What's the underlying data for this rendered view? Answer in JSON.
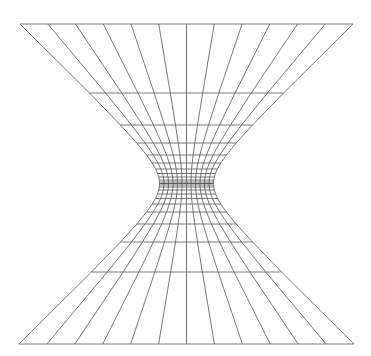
{
  "diagram": {
    "type": "hyperboloid-wireframe",
    "canvas": {
      "width": 371,
      "height": 356,
      "background": "#ffffff"
    },
    "stroke_color": "#555555",
    "center_x": 186.5,
    "waist_y": 183.5,
    "top_y": 24,
    "bottom_y": 344,
    "top_half_width": 166.5,
    "waist_half_width": 27,
    "vertical_line_count": 13,
    "upper_rows_y": [
      24,
      93,
      125,
      143,
      155,
      163,
      169,
      173.5,
      177,
      180,
      182,
      183.5
    ],
    "lower_rows_y": [
      183.5,
      185,
      187,
      190,
      194,
      198.5,
      204,
      212,
      224,
      242,
      272,
      344
    ]
  }
}
